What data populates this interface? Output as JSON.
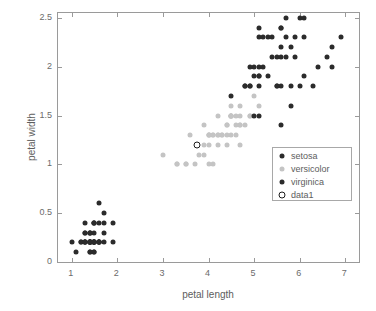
{
  "chart_data": {
    "type": "scatter",
    "title": "",
    "xlabel": "petal length",
    "ylabel": "petal width",
    "xlim": [
      0.7,
      7.3
    ],
    "ylim": [
      0,
      2.55
    ],
    "xticks": [
      1,
      2,
      3,
      4,
      5,
      6,
      7
    ],
    "xtick_labels": [
      "1",
      "2",
      "3",
      "4",
      "5",
      "6",
      "7"
    ],
    "yticks": [
      0,
      0.5,
      1,
      1.5,
      2,
      2.5
    ],
    "ytick_labels": [
      "0",
      "0.5",
      "1",
      "1.5",
      "2",
      "2.5"
    ],
    "grid": false,
    "legend_position": "center-right",
    "series": [
      {
        "name": "setosa",
        "color": "#2b2b2b",
        "marker": "filled-circle",
        "points": [
          [
            1.4,
            0.2
          ],
          [
            1.4,
            0.2
          ],
          [
            1.3,
            0.2
          ],
          [
            1.5,
            0.2
          ],
          [
            1.4,
            0.2
          ],
          [
            1.7,
            0.4
          ],
          [
            1.4,
            0.3
          ],
          [
            1.5,
            0.2
          ],
          [
            1.4,
            0.2
          ],
          [
            1.5,
            0.1
          ],
          [
            1.5,
            0.2
          ],
          [
            1.6,
            0.2
          ],
          [
            1.4,
            0.1
          ],
          [
            1.1,
            0.1
          ],
          [
            1.2,
            0.2
          ],
          [
            1.5,
            0.4
          ],
          [
            1.3,
            0.4
          ],
          [
            1.4,
            0.3
          ],
          [
            1.7,
            0.3
          ],
          [
            1.5,
            0.3
          ],
          [
            1.7,
            0.2
          ],
          [
            1.5,
            0.4
          ],
          [
            1.0,
            0.2
          ],
          [
            1.7,
            0.5
          ],
          [
            1.9,
            0.2
          ],
          [
            1.6,
            0.2
          ],
          [
            1.6,
            0.4
          ],
          [
            1.5,
            0.2
          ],
          [
            1.4,
            0.2
          ],
          [
            1.6,
            0.2
          ],
          [
            1.6,
            0.2
          ],
          [
            1.5,
            0.4
          ],
          [
            1.5,
            0.1
          ],
          [
            1.4,
            0.2
          ],
          [
            1.5,
            0.2
          ],
          [
            1.2,
            0.2
          ],
          [
            1.3,
            0.2
          ],
          [
            1.4,
            0.1
          ],
          [
            1.3,
            0.2
          ],
          [
            1.5,
            0.2
          ],
          [
            1.3,
            0.3
          ],
          [
            1.3,
            0.3
          ],
          [
            1.3,
            0.2
          ],
          [
            1.6,
            0.6
          ],
          [
            1.9,
            0.4
          ],
          [
            1.4,
            0.3
          ],
          [
            1.6,
            0.2
          ],
          [
            1.4,
            0.2
          ],
          [
            1.5,
            0.2
          ],
          [
            1.4,
            0.2
          ]
        ]
      },
      {
        "name": "versicolor",
        "color": "#c4c4c4",
        "marker": "filled-circle",
        "points": [
          [
            4.7,
            1.4
          ],
          [
            4.5,
            1.5
          ],
          [
            4.9,
            1.5
          ],
          [
            4.0,
            1.3
          ],
          [
            4.6,
            1.5
          ],
          [
            4.5,
            1.3
          ],
          [
            4.7,
            1.6
          ],
          [
            3.3,
            1.0
          ],
          [
            4.6,
            1.3
          ],
          [
            3.9,
            1.4
          ],
          [
            3.5,
            1.0
          ],
          [
            4.2,
            1.5
          ],
          [
            4.0,
            1.0
          ],
          [
            4.7,
            1.4
          ],
          [
            3.6,
            1.3
          ],
          [
            4.4,
            1.4
          ],
          [
            4.5,
            1.5
          ],
          [
            4.1,
            1.0
          ],
          [
            4.5,
            1.5
          ],
          [
            3.9,
            1.1
          ],
          [
            4.8,
            1.8
          ],
          [
            4.0,
            1.3
          ],
          [
            4.9,
            1.5
          ],
          [
            4.7,
            1.2
          ],
          [
            4.3,
            1.3
          ],
          [
            4.4,
            1.4
          ],
          [
            4.8,
            1.4
          ],
          [
            5.0,
            1.7
          ],
          [
            4.5,
            1.5
          ],
          [
            3.5,
            1.0
          ],
          [
            3.8,
            1.1
          ],
          [
            3.7,
            1.0
          ],
          [
            3.9,
            1.2
          ],
          [
            5.1,
            1.6
          ],
          [
            4.5,
            1.5
          ],
          [
            4.5,
            1.6
          ],
          [
            4.7,
            1.5
          ],
          [
            4.4,
            1.3
          ],
          [
            4.1,
            1.3
          ],
          [
            4.0,
            1.3
          ],
          [
            4.4,
            1.2
          ],
          [
            4.6,
            1.4
          ],
          [
            4.0,
            1.2
          ],
          [
            3.3,
            1.0
          ],
          [
            4.2,
            1.3
          ],
          [
            4.2,
            1.2
          ],
          [
            4.2,
            1.3
          ],
          [
            4.3,
            1.3
          ],
          [
            3.0,
            1.1
          ],
          [
            4.1,
            1.3
          ]
        ]
      },
      {
        "name": "virginica",
        "color": "#2b2b2b",
        "marker": "filled-circle",
        "points": [
          [
            6.0,
            2.5
          ],
          [
            5.1,
            1.9
          ],
          [
            5.9,
            2.1
          ],
          [
            5.6,
            1.8
          ],
          [
            5.8,
            2.2
          ],
          [
            6.6,
            2.1
          ],
          [
            4.5,
            1.7
          ],
          [
            6.3,
            1.8
          ],
          [
            5.8,
            1.8
          ],
          [
            6.1,
            2.5
          ],
          [
            5.1,
            2.0
          ],
          [
            5.3,
            1.9
          ],
          [
            5.5,
            2.1
          ],
          [
            5.0,
            2.0
          ],
          [
            5.1,
            2.4
          ],
          [
            5.3,
            2.3
          ],
          [
            5.5,
            1.8
          ],
          [
            6.7,
            2.2
          ],
          [
            6.9,
            2.3
          ],
          [
            5.0,
            1.5
          ],
          [
            5.7,
            2.3
          ],
          [
            4.9,
            2.0
          ],
          [
            6.7,
            2.0
          ],
          [
            4.9,
            1.8
          ],
          [
            5.7,
            2.1
          ],
          [
            6.0,
            1.8
          ],
          [
            4.8,
            1.8
          ],
          [
            4.9,
            1.8
          ],
          [
            5.6,
            2.1
          ],
          [
            5.8,
            1.6
          ],
          [
            6.1,
            1.9
          ],
          [
            6.4,
            2.0
          ],
          [
            5.6,
            2.2
          ],
          [
            5.1,
            1.5
          ],
          [
            5.6,
            1.4
          ],
          [
            6.1,
            2.3
          ],
          [
            5.6,
            2.4
          ],
          [
            5.5,
            1.8
          ],
          [
            4.8,
            1.8
          ],
          [
            5.4,
            2.1
          ],
          [
            5.6,
            2.4
          ],
          [
            5.1,
            2.3
          ],
          [
            5.1,
            1.9
          ],
          [
            5.9,
            2.3
          ],
          [
            5.7,
            2.5
          ],
          [
            5.2,
            2.3
          ],
          [
            5.0,
            1.9
          ],
          [
            5.2,
            2.0
          ],
          [
            5.4,
            2.3
          ],
          [
            5.1,
            1.8
          ]
        ]
      },
      {
        "name": "data1",
        "color": "#1c1c1c",
        "marker": "open-circle",
        "points": [
          [
            3.75,
            1.2
          ]
        ]
      }
    ]
  },
  "legend": {
    "entries": [
      {
        "label": "setosa",
        "marker": "filled-circle",
        "color": "#2b2b2b"
      },
      {
        "label": "versicolor",
        "marker": "filled-circle",
        "color": "#c4c4c4"
      },
      {
        "label": "virginica",
        "marker": "filled-circle",
        "color": "#2b2b2b"
      },
      {
        "label": "data1",
        "marker": "open-circle",
        "color": "#1c1c1c"
      }
    ]
  }
}
